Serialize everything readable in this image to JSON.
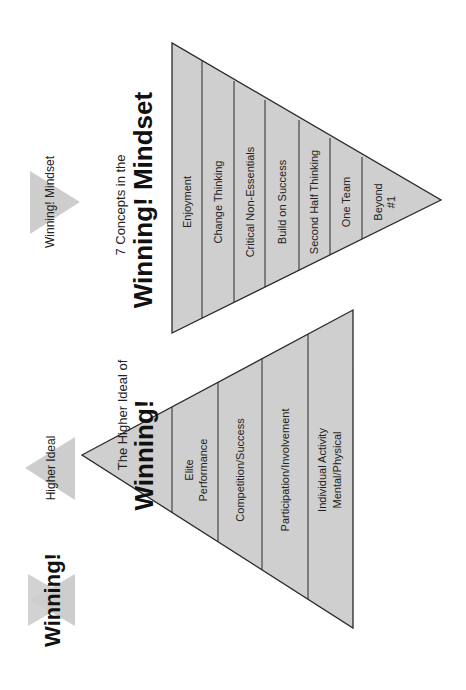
{
  "orientation": "rotated 90 degrees counter-clockwise",
  "colors": {
    "fill": "#cfcfcf",
    "icon_fill": "#cdcdcd",
    "stroke": "#2a2a2a",
    "text": "#111111"
  },
  "legend": {
    "winning": {
      "label": "Winning!",
      "icon": "star-of-david-icon"
    },
    "higher_ideal": {
      "label": "Higher Ideal",
      "icon": "triangle-up-icon"
    },
    "winning_mindset": {
      "label": "Winning! Mindset",
      "icon": "triangle-down-icon"
    }
  },
  "higher_ideal_pyramid": {
    "title_small": "The Higher Ideal of",
    "title_large": "Winning!",
    "levels": [
      {
        "line1": "Elite",
        "line2": "Performance"
      },
      {
        "line1": "Competition/Success"
      },
      {
        "line1": "Participation/Involvement"
      },
      {
        "line1": "Individual Activity",
        "line2": "Mental/Physical"
      }
    ]
  },
  "mindset_pyramid": {
    "title_small": "7 Concepts in the",
    "title_large": "Winning! Mindset",
    "levels": [
      {
        "line1": "Enjoyment"
      },
      {
        "line1": "Change Thinking"
      },
      {
        "line1": "Critical Non-Essentials"
      },
      {
        "line1": "Build on Success"
      },
      {
        "line1": "Second Half Thinking"
      },
      {
        "line1": "One Team"
      },
      {
        "line1": "Beyond",
        "line2": "#1"
      }
    ]
  }
}
